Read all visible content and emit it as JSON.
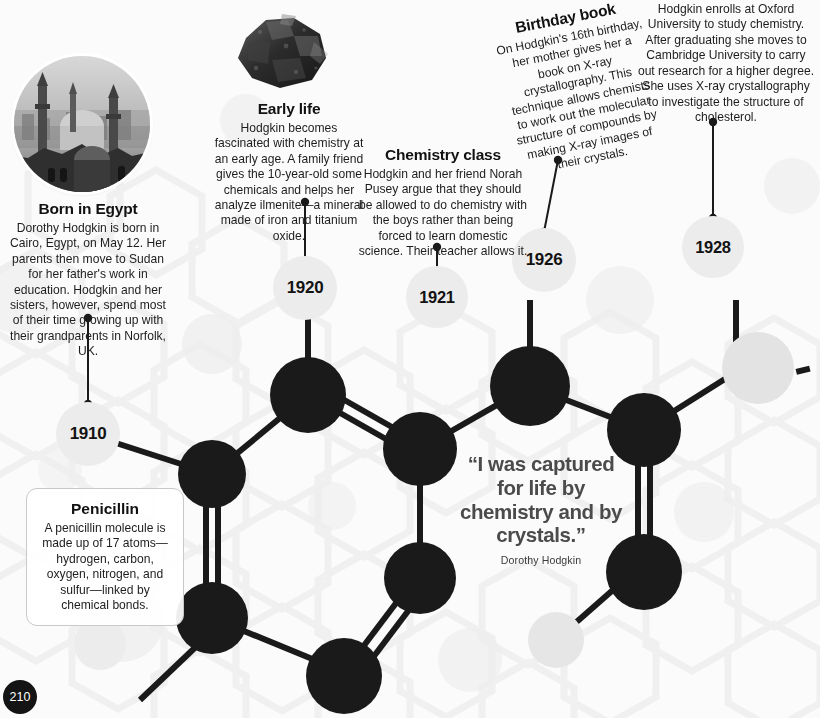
{
  "page": {
    "number": "210",
    "background_color": "#fbfbfb",
    "atom_color": "#1a1a1a",
    "year_marker_color": "#ececec",
    "quote_color": "#4b4b4b"
  },
  "photos": [
    {
      "name": "cairo-skyline-photo",
      "alt": "Black and white photograph of the Cairo skyline with mosque minarets and domes"
    },
    {
      "name": "ilmenite-mineral-photo",
      "alt": "Dark grey ilmenite mineral specimen"
    }
  ],
  "blocks": [
    {
      "id": "born-in-egypt",
      "heading": "Born in Egypt",
      "body": "Dorothy Hodgkin is born in Cairo, Egypt, on May 12. Her parents then move to Sudan for her father's work in education. Hodgkin and her sisters, however, spend most of their time growing up with their grandparents in Norfolk, UK."
    },
    {
      "id": "early-life",
      "heading": "Early life",
      "body": "Hodgkin becomes fascinated with chemistry at an early age. A family friend gives the 10-year-old some chemicals and helps her analyze ilmenite—a mineral made of iron and titanium oxide."
    },
    {
      "id": "chemistry-class",
      "heading": "Chemistry class",
      "body": "Hodgkin and her friend Norah Pusey argue that they should be allowed to do chemistry with the boys rather than being forced to learn domestic science. Their teacher allows it."
    },
    {
      "id": "birthday-book",
      "heading": "Birthday book",
      "body": "On Hodgkin's 16th birthday, her mother gives her a book on X-ray crystallography. This technique allows chemists to work out the molecular structure of compounds by making X-ray images of their crystals."
    },
    {
      "id": "oxford-university",
      "heading": "",
      "body": "Hodgkin enrolls at Oxford University to study chemistry. After graduating she moves to Cambridge University to carry out research for a higher degree. She uses X-ray crystallography to investigate the structure of cholesterol."
    }
  ],
  "callout": {
    "heading": "Penicillin",
    "body": "A penicillin molecule is made up of 17 atoms—hydrogen, carbon, oxygen, nitrogen, and sulfur—linked by chemical bonds."
  },
  "years": [
    {
      "label": "1910"
    },
    {
      "label": "1920"
    },
    {
      "label": "1921"
    },
    {
      "label": "1926"
    },
    {
      "label": "1928"
    }
  ],
  "quote": {
    "text": "“I was captured for life by chemistry and by crystals.”",
    "attribution": "Dorothy Hodgkin"
  }
}
